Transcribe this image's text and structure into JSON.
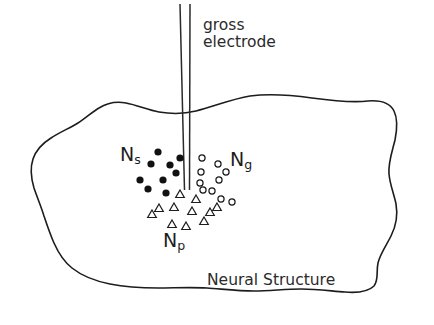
{
  "figure": {
    "width": 434,
    "height": 325,
    "background_color": "#ffffff",
    "ink_color": "#1c1c1c"
  },
  "labels": {
    "gross_electrode": "gross\nelectrode",
    "neural_structure": "Neural Structure",
    "ns_base": "N",
    "ns_sub": "s",
    "ng_base": "N",
    "ng_sub": "g",
    "np_base": "N",
    "np_sub": "p"
  },
  "diagram_data": {
    "type": "schematic",
    "outline_name": "Neural Structure",
    "outline_path": "M 196 111 C 215 106 232 99 250 96 C 272 93 291 95 312 98 C 334 101 352 103 368 101 C 381 100 390 103 394 111 C 398 119 397 130 395 140 C 392 152 388 163 389 174 C 390 185 394 194 396 204 C 398 215 396 226 391 236 C 386 246 380 254 378 263 C 376 272 379 280 374 286 C 368 292 357 293 345 292 C 331 291 316 289 301 289 C 285 289 270 291 254 291 C 238 291 222 289 207 288 C 190 287 174 288 158 288 C 141 288 125 287 110 284 C 95 281 82 276 72 268 C 63 261 58 252 54 243 C 50 234 47 225 44 216 C 41 206 37 197 34 188 C 31 178 30 168 33 159 C 36 150 43 143 51 138 C 60 132 70 128 78 123 C 86 118 92 112 99 108 C 107 103 116 101 126 103 C 137 105 148 110 159 112 C 171 114 184 114 196 111 Z",
    "electrode": {
      "label": "gross electrode",
      "left_line": [
        [
          180,
          4
        ],
        [
          184,
          190
        ]
      ],
      "right_line": [
        [
          190,
          4
        ],
        [
          189,
          190
        ]
      ],
      "tip_y": 190
    },
    "populations": [
      {
        "symbol": "Ns",
        "marker": "filled-circle",
        "count": 9,
        "label_position": [
          120,
          143
        ],
        "points": [
          [
            158,
            152
          ],
          [
            180,
            158
          ],
          [
            151,
            164
          ],
          [
            176,
            173
          ],
          [
            163,
            180
          ],
          [
            148,
            189
          ],
          [
            166,
            193
          ],
          [
            140,
            180
          ],
          [
            170,
            165
          ]
        ]
      },
      {
        "symbol": "Ng",
        "marker": "open-circle",
        "count": 10,
        "label_position": [
          230,
          148
        ],
        "points": [
          [
            202,
            158
          ],
          [
            218,
            164
          ],
          [
            201,
            172
          ],
          [
            219,
            180
          ],
          [
            203,
            190
          ],
          [
            221,
            198
          ],
          [
            232,
            202
          ],
          [
            200,
            182
          ],
          [
            212,
            190
          ],
          [
            226,
            172
          ]
        ]
      },
      {
        "symbol": "Np",
        "marker": "open-triangle",
        "count": 11,
        "label_position": [
          163,
          229
        ],
        "points": [
          [
            180,
            194
          ],
          [
            159,
            208
          ],
          [
            174,
            207
          ],
          [
            192,
            211
          ],
          [
            209,
            212
          ],
          [
            172,
            224
          ],
          [
            186,
            226
          ],
          [
            205,
            221
          ],
          [
            196,
            199
          ],
          [
            152,
            214
          ],
          [
            217,
            207
          ]
        ]
      }
    ]
  }
}
